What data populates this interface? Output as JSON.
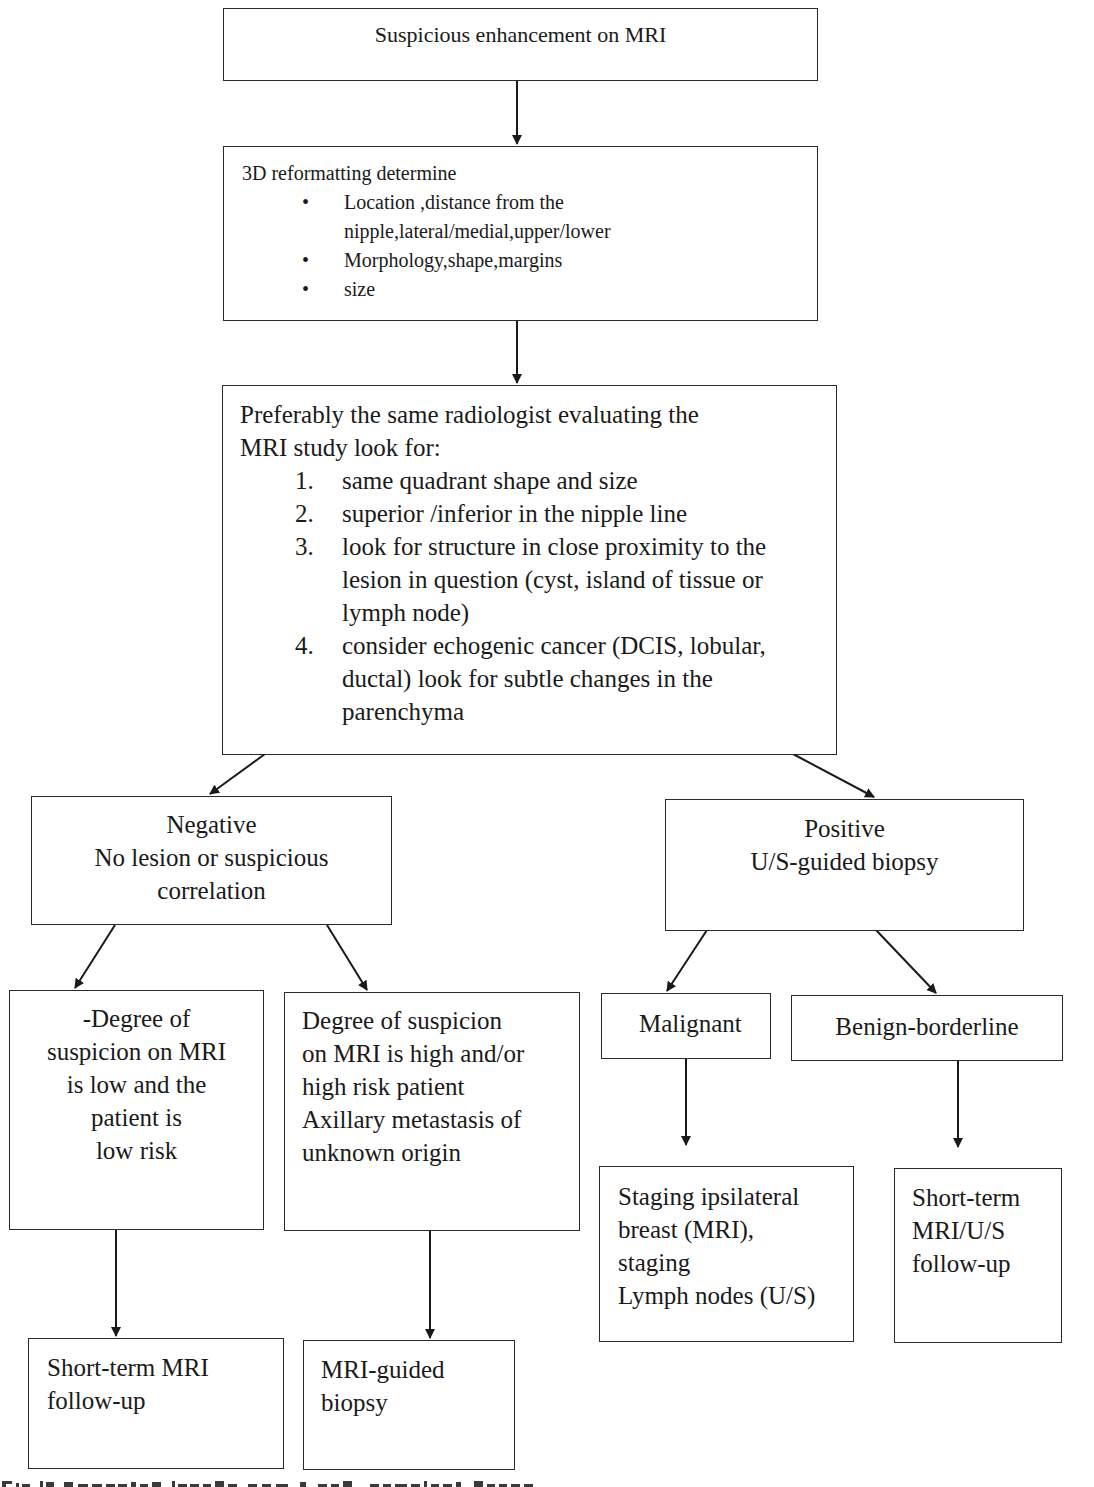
{
  "diagram": {
    "type": "flowchart",
    "nodes": {
      "start": {
        "text": "Suspicious enhancement on MRI"
      },
      "reformat": {
        "heading": "3D reformatting determine",
        "bullets": [
          {
            "line1": "Location ,distance from the",
            "line2": "nipple,lateral/medial,upper/lower"
          },
          {
            "line1": "Morphology,shape,margins"
          },
          {
            "line1": "size"
          }
        ],
        "bullet_glyph": "•"
      },
      "evaluate": {
        "intro_line1": "Preferably the same radiologist evaluating the",
        "intro_line2": "MRI study look for:",
        "items": [
          {
            "num": "1.",
            "lines": [
              "same quadrant shape and size"
            ]
          },
          {
            "num": "2.",
            "lines": [
              "superior /inferior in the nipple line"
            ]
          },
          {
            "num": "3.",
            "lines": [
              "look for structure in close proximity to the",
              "lesion in question (cyst, island of tissue or",
              "lymph node)"
            ]
          },
          {
            "num": "4.",
            "lines": [
              "consider echogenic cancer (DCIS, lobular,",
              "ductal) look for subtle changes in the",
              "parenchyma"
            ]
          }
        ]
      },
      "negative": {
        "lines": [
          "Negative",
          "No lesion or suspicious",
          "correlation"
        ]
      },
      "positive": {
        "lines": [
          "Positive",
          "U/S-guided biopsy"
        ]
      },
      "low_suspicion": {
        "lines": [
          "-Degree of",
          "suspicion on MRI",
          "is low and  the",
          "patient is",
          "low risk"
        ]
      },
      "high_suspicion": {
        "lines": [
          "Degree of suspicion",
          "on MRI is high and/or",
          "high risk patient",
          "Axillary metastasis of",
          "unknown origin"
        ]
      },
      "malignant": {
        "text": "Malignant"
      },
      "benign": {
        "text": "Benign-borderline"
      },
      "staging": {
        "lines": [
          "Staging ipsilateral",
          "breast (MRI),",
          "staging",
          "Lymph nodes (U/S)"
        ]
      },
      "followup_us": {
        "lines": [
          "Short-term",
          "MRI/U/S",
          "follow-up"
        ]
      },
      "followup_mri": {
        "lines": [
          "Short-term MRI",
          "follow-up"
        ]
      },
      "mri_biopsy": {
        "lines": [
          "MRI-guided",
          "biopsy"
        ]
      }
    },
    "edges": [
      [
        "start",
        "reformat"
      ],
      [
        "reformat",
        "evaluate"
      ],
      [
        "evaluate",
        "negative"
      ],
      [
        "evaluate",
        "positive"
      ],
      [
        "negative",
        "low_suspicion"
      ],
      [
        "negative",
        "high_suspicion"
      ],
      [
        "positive",
        "malignant"
      ],
      [
        "positive",
        "benign"
      ],
      [
        "low_suspicion",
        "followup_mri"
      ],
      [
        "high_suspicion",
        "mri_biopsy"
      ],
      [
        "malignant",
        "staging"
      ],
      [
        "benign",
        "followup_us"
      ]
    ],
    "colors": {
      "line": "#2a2a2a",
      "background": "#ffffff",
      "text": "#1a1a1a"
    }
  }
}
